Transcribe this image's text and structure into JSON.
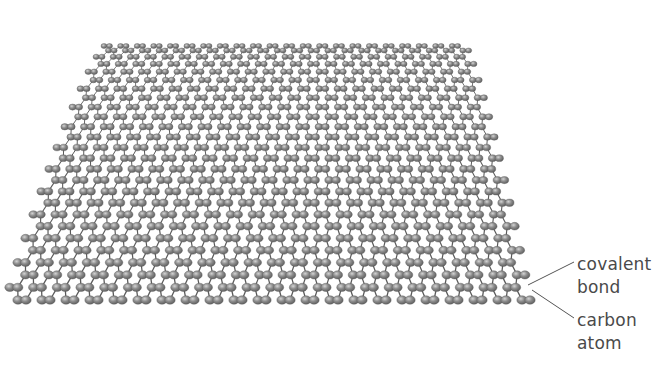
{
  "diagram": {
    "lattice": {
      "type": "hexagonal",
      "cols": 22,
      "rows": 26,
      "bond_color": "#5a5a5a",
      "atom_fill": "#8c8c8c",
      "atom_highlight": "#cfcfcf",
      "atom_stroke": "#5e5e5e"
    },
    "projection": {
      "far_edge": {
        "y": 46,
        "x_left": 104,
        "x_right": 466
      },
      "near_edge": {
        "y": 300,
        "x_left": 6,
        "x_right": 530
      },
      "near_atom_radius": 5.2,
      "far_atom_radius": 3.0
    },
    "annotations": [
      {
        "id": "covalent-bond",
        "lines": [
          "covalent",
          "bond"
        ],
        "pointer_from": [
          574,
          262
        ],
        "pointer_to": [
          528,
          285
        ]
      },
      {
        "id": "carbon-atom",
        "lines": [
          "carbon",
          "atom"
        ],
        "pointer_from": [
          574,
          318
        ],
        "pointer_to": [
          532,
          290
        ]
      }
    ]
  }
}
